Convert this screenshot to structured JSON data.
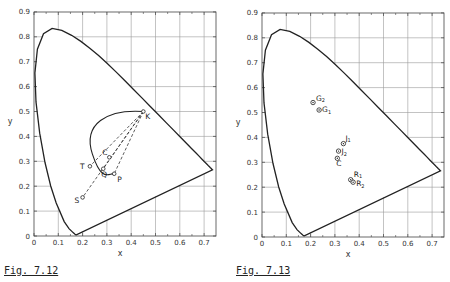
{
  "chart_data": [
    {
      "type": "scatter",
      "title": "CIE 1931 chromaticity diagram with spectrum locus, purple line and dominant-wavelength construction",
      "caption": "Fig. 7.12",
      "xlabel": "x",
      "ylabel": "y",
      "xlim": [
        0,
        0.75
      ],
      "ylim": [
        0,
        0.9
      ],
      "xticks": [
        "0",
        "0.1",
        "0.2",
        "0.3",
        "0.4",
        "0.5",
        "0.6",
        "0.7"
      ],
      "yticks": [
        "0",
        "0.1",
        "0.2",
        "0.3",
        "0.4",
        "0.5",
        "0.6",
        "0.7",
        "0.8",
        "0.9"
      ],
      "grid": "outside locus only",
      "points": [
        {
          "label": "K",
          "x": 0.45,
          "y": 0.5
        },
        {
          "label": "C",
          "x": 0.31,
          "y": 0.316
        },
        {
          "label": "T",
          "x": 0.23,
          "y": 0.28
        },
        {
          "label": "Q",
          "x": 0.285,
          "y": 0.27
        },
        {
          "label": "P",
          "x": 0.33,
          "y": 0.25
        },
        {
          "label": "S",
          "x": 0.2,
          "y": 0.155
        }
      ],
      "lines": [
        {
          "from": "K",
          "to": "S",
          "style": "dashed"
        },
        {
          "from": "K",
          "to": "Q",
          "style": "dashed"
        },
        {
          "from": "K",
          "to": "P",
          "style": "dashed"
        },
        {
          "from": "K",
          "to": "T",
          "style": "dashed"
        }
      ],
      "curves": [
        "spectrum locus",
        "Planckian locus from K"
      ]
    },
    {
      "type": "scatter",
      "title": "CIE 1931 chromaticity diagram with sample chromaticities",
      "caption": "Fig. 7.13",
      "xlabel": "x",
      "ylabel": "y",
      "xlim": [
        0,
        0.75
      ],
      "ylim": [
        0,
        0.9
      ],
      "xticks": [
        "0",
        "0.1",
        "0.2",
        "0.3",
        "0.4",
        "0.5",
        "0.6",
        "0.7"
      ],
      "yticks": [
        "0",
        "0.1",
        "0.2",
        "0.3",
        "0.4",
        "0.5",
        "0.6",
        "0.7",
        "0.8",
        "0.9"
      ],
      "grid": "outside locus only",
      "points": [
        {
          "label": "G2",
          "x": 0.21,
          "y": 0.54
        },
        {
          "label": "G1",
          "x": 0.235,
          "y": 0.51
        },
        {
          "label": "J1",
          "x": 0.335,
          "y": 0.375
        },
        {
          "label": "J2",
          "x": 0.315,
          "y": 0.345
        },
        {
          "label": "C",
          "x": 0.31,
          "y": 0.316
        },
        {
          "label": "R1",
          "x": 0.365,
          "y": 0.23
        },
        {
          "label": "R2",
          "x": 0.375,
          "y": 0.22
        }
      ]
    }
  ]
}
